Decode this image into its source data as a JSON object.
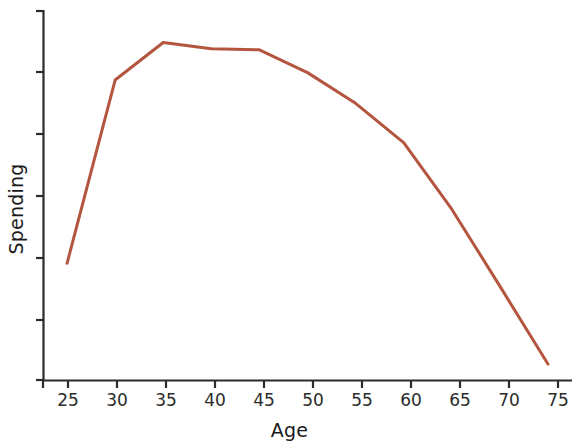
{
  "chart_data": {
    "type": "line",
    "title": "",
    "xlabel": "Age",
    "ylabel": "Spending",
    "x": [
      25,
      30,
      35,
      40,
      45,
      50,
      55,
      60,
      65,
      70,
      75
    ],
    "values": [
      2.05,
      5.27,
      5.93,
      5.82,
      5.8,
      5.4,
      4.86,
      4.17,
      3.0,
      1.65,
      0.28
    ],
    "series": [
      {
        "name": "Spending",
        "color": "#b4563f",
        "values": [
          2.05,
          5.27,
          5.93,
          5.82,
          5.8,
          5.4,
          4.86,
          4.17,
          3.0,
          1.65,
          0.28
        ]
      }
    ],
    "xtick_labels": [
      "25",
      "30",
      "35",
      "40",
      "45",
      "50",
      "55",
      "60",
      "65",
      "70",
      "75"
    ],
    "ytick_labels": [
      "",
      "",
      "",
      "",
      "",
      "",
      ""
    ],
    "xlim": [
      22.5,
      77.5
    ],
    "ylim": [
      0,
      6.5
    ],
    "grid": false,
    "legend": false,
    "axis_color": "#2b2b2b",
    "line_color": "#b4563f"
  },
  "axes": {
    "x_title": "Age",
    "y_title": "Spending"
  }
}
